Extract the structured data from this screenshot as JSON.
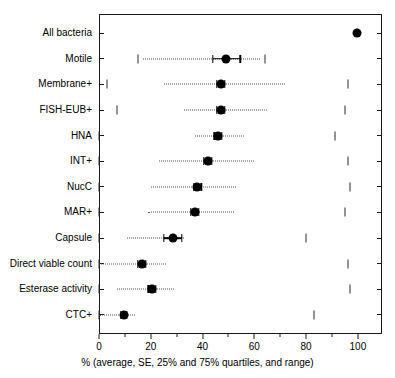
{
  "chart_data": {
    "type": "scatter",
    "title": "",
    "subtitle": "",
    "xlabel": "% (average, SE, 25% and 75% quartiles, and range)",
    "ylabel": "",
    "xlim": [
      0,
      109.3
    ],
    "ylim": [
      0,
      12
    ],
    "grid": false,
    "legend": null,
    "xticks": [
      0,
      20,
      40,
      60,
      80,
      100
    ],
    "xticklabels": [
      "0",
      "20",
      "40",
      "60",
      "80",
      "100"
    ],
    "xticks_minor": [
      10,
      30,
      50,
      70,
      90
    ],
    "categories": [
      "All bacteria",
      "Motile",
      "Membrane+",
      "FISH-EUB+",
      "HNA",
      "INT+",
      "NucC",
      "MAR+",
      "Capsule",
      "Direct viable count",
      "Esterase activity",
      "CTC+"
    ],
    "series": [
      {
        "name": "average",
        "values": [
          99.5,
          49.0,
          47.0,
          47.0,
          46.0,
          42.0,
          38.0,
          37.0,
          28.5,
          16.5,
          20.5,
          9.5
        ]
      },
      {
        "name": "se_low",
        "values": [
          null,
          44.0,
          45.5,
          45.5,
          44.5,
          40.5,
          36.5,
          35.5,
          25.0,
          15.0,
          19.0,
          8.5
        ]
      },
      {
        "name": "se_high",
        "values": [
          null,
          54.5,
          48.5,
          48.5,
          47.5,
          43.5,
          39.5,
          38.5,
          32.0,
          18.0,
          22.0,
          10.5
        ]
      },
      {
        "name": "quartile_25",
        "values": [
          null,
          17.0,
          25.0,
          33.0,
          37.0,
          23.0,
          20.0,
          19.0,
          11.0,
          0.0,
          7.0,
          0.0
        ]
      },
      {
        "name": "quartile_75",
        "values": [
          null,
          62.0,
          72.0,
          65.0,
          56.0,
          60.0,
          53.0,
          52.0,
          33.0,
          26.0,
          29.0,
          14.0
        ]
      },
      {
        "name": "range_min",
        "values": [
          null,
          15.0,
          3.0,
          7.0,
          0.0,
          0.0,
          0.0,
          0.0,
          0.0,
          0.0,
          0.0,
          0.0
        ]
      },
      {
        "name": "range_max",
        "values": [
          null,
          64.0,
          96.0,
          95.0,
          91.0,
          96.0,
          97.0,
          95.0,
          80.0,
          96.0,
          97.0,
          83.0
        ]
      }
    ]
  },
  "axis": {
    "x_label_text": "% (average, SE, 25% and 75% quartiles, and range)",
    "tick_0": "0",
    "tick_20": "20",
    "tick_40": "40",
    "tick_60": "60",
    "tick_80": "80",
    "tick_100": "100"
  },
  "style": {
    "marker_color": "#000000",
    "line_color": "#555555",
    "axis_color": "#1a1a1a",
    "background": "#ffffff"
  }
}
